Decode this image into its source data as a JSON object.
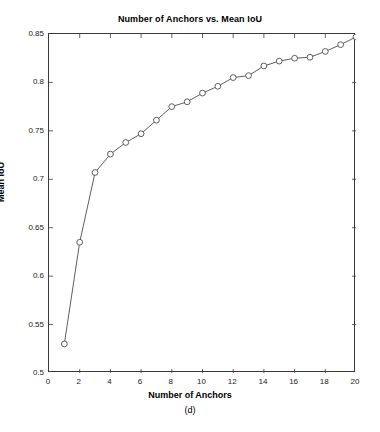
{
  "figure": {
    "title": "Number of Anchors vs. Mean IoU",
    "xlabel": "Number of Anchors",
    "ylabel": "Mean IoU",
    "caption": "(d)"
  },
  "axes": {
    "x_ticks": [
      "0",
      "2",
      "4",
      "6",
      "8",
      "10",
      "12",
      "14",
      "16",
      "18",
      "20"
    ],
    "y_ticks": [
      "0.5",
      "0.55",
      "0.6",
      "0.65",
      "0.7",
      "0.75",
      "0.8",
      "0.85"
    ]
  },
  "style": {
    "line_color": "#4d4d4d",
    "marker_edge_color": "#4d4d4d",
    "marker_face_color": "#ffffff",
    "axis_color": "#3a3a3a",
    "background": "#ffffff"
  },
  "chart_data": {
    "type": "line",
    "title": "Number of Anchors vs. Mean IoU",
    "xlabel": "Number of Anchors",
    "ylabel": "Mean IoU",
    "xlim": [
      0,
      20
    ],
    "ylim": [
      0.5,
      0.85
    ],
    "xticks": [
      0,
      2,
      4,
      6,
      8,
      10,
      12,
      14,
      16,
      18,
      20
    ],
    "yticks": [
      0.5,
      0.55,
      0.6,
      0.65,
      0.7,
      0.75,
      0.8,
      0.85
    ],
    "grid": false,
    "legend": "none",
    "marker": "circle",
    "x": [
      1,
      2,
      3,
      4,
      5,
      6,
      7,
      8,
      9,
      10,
      11,
      12,
      13,
      14,
      15,
      16,
      17,
      18,
      19,
      20
    ],
    "y": [
      0.53,
      0.635,
      0.707,
      0.726,
      0.738,
      0.747,
      0.761,
      0.775,
      0.78,
      0.789,
      0.796,
      0.805,
      0.807,
      0.817,
      0.822,
      0.825,
      0.826,
      0.832,
      0.839,
      0.847
    ],
    "series": [
      {
        "name": "Mean IoU",
        "values": [
          0.53,
          0.635,
          0.707,
          0.726,
          0.738,
          0.747,
          0.761,
          0.775,
          0.78,
          0.789,
          0.796,
          0.805,
          0.807,
          0.817,
          0.822,
          0.825,
          0.826,
          0.832,
          0.839,
          0.847
        ]
      }
    ]
  }
}
